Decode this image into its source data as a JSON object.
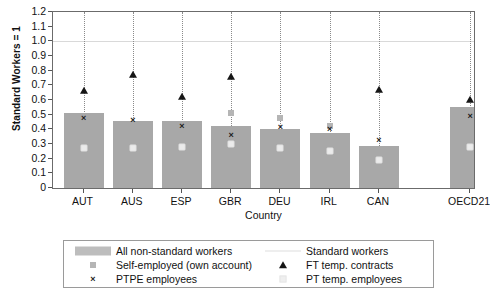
{
  "chart_data": {
    "type": "bar",
    "title": "",
    "xlabel": "Country",
    "ylabel": "Standard Workers = 1",
    "ylim": [
      0,
      1.2
    ],
    "yticks": [
      "0",
      "0.1",
      "0.2",
      "0.3",
      "0.4",
      "0.5",
      "0.6",
      "0.7",
      "0.8",
      "0.9",
      "1.0",
      "1.1",
      "1.2"
    ],
    "ytick_values": [
      0,
      0.1,
      0.2,
      0.3,
      0.4,
      0.5,
      0.6,
      0.7,
      0.8,
      0.9,
      1.0,
      1.1,
      1.2
    ],
    "grid": false,
    "legend_position": "below-axes",
    "categories": [
      "AUT",
      "AUS",
      "ESP",
      "GBR",
      "DEU",
      "IRL",
      "CAN",
      "OECD21"
    ],
    "reference_line": {
      "label": "Standard workers",
      "value": 1.0,
      "color": "#d9d9d9"
    },
    "series": [
      {
        "name": "All non-standard workers",
        "marker": "bar",
        "color": "#a8a8a8",
        "values": [
          0.51,
          0.46,
          0.46,
          0.42,
          0.4,
          0.375,
          0.285,
          0.55
        ]
      },
      {
        "name": "Self-employed (own account)",
        "marker": "square",
        "color": "#b5b5b5",
        "values": [
          null,
          null,
          null,
          0.51,
          0.48,
          0.425,
          null,
          null
        ]
      },
      {
        "name": "PTPE employees",
        "marker": "x",
        "color": "#1d1d1d",
        "values": [
          0.48,
          0.465,
          0.425,
          0.36,
          0.415,
          0.405,
          0.33,
          0.49
        ]
      },
      {
        "name": "FT temp. contracts",
        "marker": "triangle",
        "color": "#151515",
        "values": [
          0.66,
          0.77,
          0.62,
          0.76,
          null,
          null,
          0.67,
          0.6
        ]
      },
      {
        "name": "PT temp. employees",
        "marker": "light-square",
        "color": "#ebebeb",
        "values": [
          0.27,
          0.27,
          0.28,
          0.3,
          0.27,
          0.25,
          0.19,
          0.28
        ]
      }
    ]
  },
  "legend": {
    "left_column": [
      {
        "label": "All non-standard workers",
        "key": "bar-swatch"
      },
      {
        "label": "Self-employed (own account)",
        "key": "square-marker"
      },
      {
        "label": "PTPE employees",
        "key": "x-marker"
      }
    ],
    "right_column": [
      {
        "label": "Standard workers",
        "key": "dashed-line"
      },
      {
        "label": "FT temp. contracts",
        "key": "triangle-marker"
      },
      {
        "label": "PT temp. employees",
        "key": "light-square-marker"
      }
    ]
  }
}
